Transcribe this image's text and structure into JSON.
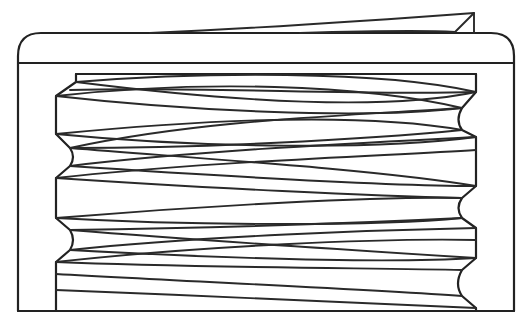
{
  "figure": {
    "type": "technical line drawing",
    "line_color": "#222222",
    "background_color": "#ffffff",
    "labels": []
  },
  "parts": {
    "outer_cap": "cap-shell",
    "top_band": "cap-top-band",
    "tab": "tamper-tab",
    "thread_core": "threaded-insert",
    "threads": "helical-thread-lines"
  }
}
